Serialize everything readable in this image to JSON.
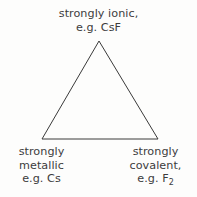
{
  "diagram": {
    "background_color": "#fdfdfc",
    "stroke_color": "#3a3a3a",
    "text_color": "#3c3c3c",
    "shape": {
      "name": "triangle",
      "apex": {
        "x": 99,
        "y": 41
      },
      "bottom_left": {
        "x": 42,
        "y": 139
      },
      "bottom_right": {
        "x": 158,
        "y": 139
      },
      "fill": "none",
      "stroke_width": 1
    },
    "vertices": {
      "top": {
        "position": "apex",
        "line1": "strongly ionic,",
        "line2": "e.g. CsF",
        "example_formula": "CsF"
      },
      "bottom_left": {
        "position": "bottom-left",
        "line1": "strongly",
        "line2": "metallic",
        "line3_prefix": "e.g. Cs",
        "example_formula": "Cs"
      },
      "bottom_right": {
        "position": "bottom-right",
        "line1": "strongly",
        "line2": "covalent,",
        "line3_prefix": "e.g. F",
        "line3_subscript": "2",
        "example_formula": "F2"
      }
    }
  }
}
